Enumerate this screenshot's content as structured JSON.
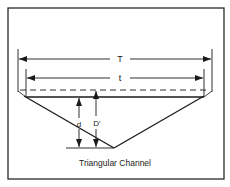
{
  "diagram": {
    "caption": "Triangular Channel",
    "labels": {
      "top_width": "T",
      "water_surface_width": "t",
      "depth": "d",
      "critical_depth": "D'"
    },
    "colors": {
      "line": "#1a1a1a",
      "background": "#ffffff",
      "frame": "#2a2a2a"
    }
  }
}
